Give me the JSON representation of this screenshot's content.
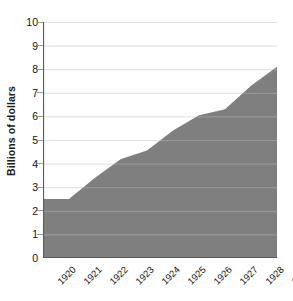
{
  "chart_data": {
    "type": "area",
    "title": "",
    "subtitle": "",
    "xlabel": "",
    "ylabel": "Billions of dollars",
    "categories": [
      "1920",
      "1921",
      "1922",
      "1923",
      "1924",
      "1925",
      "1926",
      "1927",
      "1928",
      "1929"
    ],
    "x": [
      1920,
      1921,
      1922,
      1923,
      1924,
      1925,
      1926,
      1927,
      1928,
      1929
    ],
    "values": [
      2.5,
      2.5,
      3.4,
      4.2,
      4.55,
      5.4,
      6.05,
      6.3,
      7.3,
      8.1
    ],
    "series": [
      {
        "name": "",
        "values": [
          2.5,
          2.5,
          3.4,
          4.2,
          4.55,
          5.4,
          6.05,
          6.3,
          7.3,
          8.1
        ]
      }
    ],
    "ylim": [
      0,
      10
    ],
    "xlim": [
      1920,
      1929
    ],
    "yticks": [
      0,
      1,
      2,
      3,
      4,
      5,
      6,
      7,
      8,
      9,
      10
    ],
    "ytick_labels": [
      "0",
      "1",
      "2",
      "3",
      "4",
      "5",
      "6",
      "7",
      "8",
      "9",
      "10"
    ],
    "grid": true,
    "grid_axis": "y",
    "legend": false,
    "legend_position": "none",
    "fill_color": "#7f7f7f",
    "grid_color": "#d9d9d9",
    "axis_color": "#595959",
    "text_color": "#111111",
    "background_color": "#ffffff",
    "xtick_rotation": -45
  }
}
